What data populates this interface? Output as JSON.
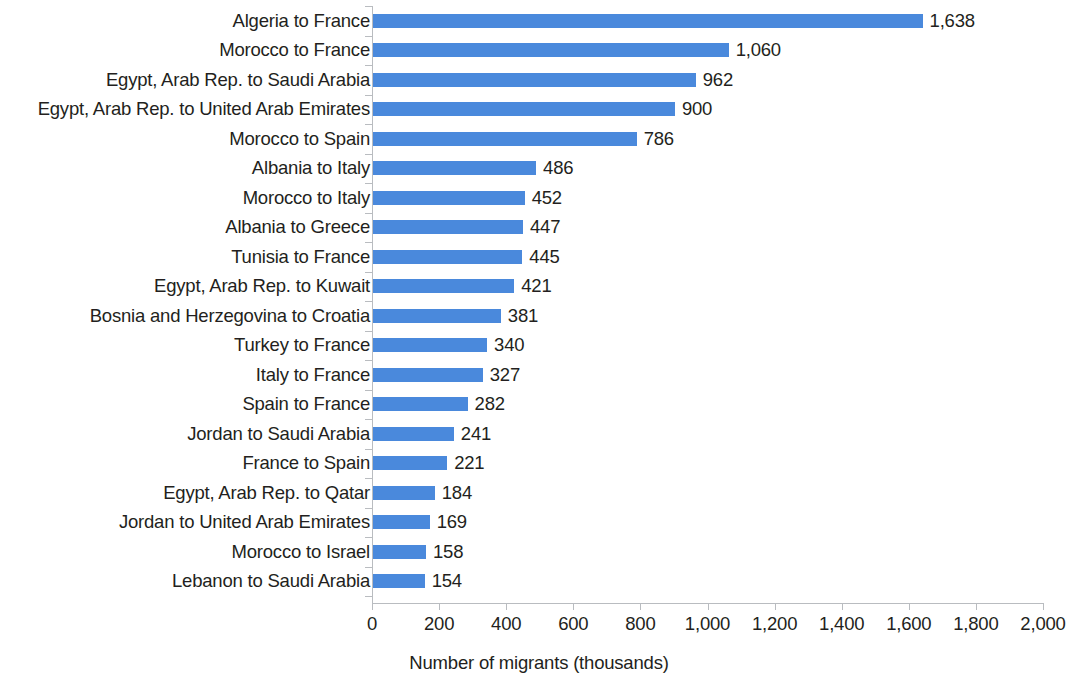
{
  "chart_data": {
    "type": "bar",
    "orientation": "horizontal",
    "title": "",
    "xlabel": "Number of migrants (thousands)",
    "ylabel": "",
    "xlim": [
      0,
      2000
    ],
    "grid": false,
    "legend": null,
    "bar_color": "#4a89dc",
    "text_color": "#231f20",
    "axis_color": "#b9bcc0",
    "xticks": [
      "0",
      "200",
      "400",
      "600",
      "800",
      "1,000",
      "1,200",
      "1,400",
      "1,600",
      "1,800",
      "2,000"
    ],
    "xtick_values": [
      0,
      200,
      400,
      600,
      800,
      1000,
      1200,
      1400,
      1600,
      1800,
      2000
    ],
    "categories": [
      "Algeria to France",
      "Morocco to France",
      "Egypt, Arab Rep. to Saudi Arabia",
      "Egypt, Arab Rep. to United Arab Emirates",
      "Morocco to Spain",
      "Albania to Italy",
      "Morocco to Italy",
      "Albania to Greece",
      "Tunisia to France",
      "Egypt, Arab Rep. to Kuwait",
      "Bosnia and Herzegovina to Croatia",
      "Turkey to France",
      "Italy to France",
      "Spain to France",
      "Jordan to Saudi Arabia",
      "France to Spain",
      "Egypt, Arab Rep. to Qatar",
      "Jordan to United Arab Emirates",
      "Morocco to Israel",
      "Lebanon to Saudi Arabia"
    ],
    "values": [
      1638,
      1060,
      962,
      900,
      786,
      486,
      452,
      447,
      445,
      421,
      381,
      340,
      327,
      282,
      241,
      221,
      184,
      169,
      158,
      154
    ],
    "value_labels": [
      "1,638",
      "1,060",
      "962",
      "900",
      "786",
      "486",
      "452",
      "447",
      "445",
      "421",
      "381",
      "340",
      "327",
      "282",
      "241",
      "221",
      "184",
      "169",
      "158",
      "154"
    ]
  }
}
